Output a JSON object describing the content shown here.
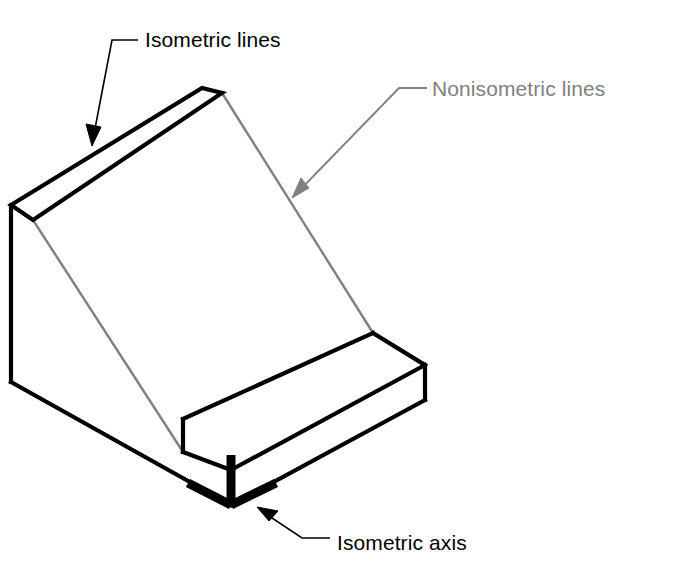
{
  "figure": {
    "background_color": "#ffffff",
    "line_color_isometric": "#000000",
    "line_color_nonisometric": "#808080",
    "axis_color": "#000000"
  },
  "annotations": {
    "isometric_lines": {
      "label": "Isometric lines",
      "color": "#000000",
      "text_x": 145,
      "text_y": 47,
      "leader_path": "M 138 40 L 112 40 L 93 139",
      "arrow_points": "92,146 86,124 101,127"
    },
    "nonisometric_lines": {
      "label": "Nonisometric lines",
      "color": "#808080",
      "text_x": 432,
      "text_y": 96,
      "leader_path": "M 427 88 L 399 88 L 296 194",
      "arrow_points": "292,198 301,178 309,188"
    },
    "isometric_axis": {
      "label": "Isometric axis",
      "color": "#000000",
      "text_x": 337,
      "text_y": 550,
      "leader_path": "M 330 538 L 302 538 L 263 512",
      "arrow_points": "257,507 278,511 269,521"
    }
  },
  "object_geometry": {
    "isometric_edges": [
      {
        "name": "top-face-outline",
        "d": "M 11 205 L 202 88 L 222 93 L 33 220 Z"
      },
      {
        "name": "left-vertical-edge",
        "d": "M 11 205 L 11 382"
      },
      {
        "name": "left-bottom-edge",
        "d": "M 11 382 L 231 505"
      },
      {
        "name": "base-bottom-right-edge",
        "d": "M 231 505 L 425 400"
      },
      {
        "name": "base-right-vertical-edge",
        "d": "M 425 400 L 425 365"
      },
      {
        "name": "base-top-right-edge",
        "d": "M 425 365 L 231 470"
      },
      {
        "name": "base-top-left-edge",
        "d": "M 231 470 L 183 452"
      },
      {
        "name": "base-front-left-vertical",
        "d": "M 183 452 L 183 419"
      },
      {
        "name": "base-far-top-edge",
        "d": "M 183 419 L 373 333"
      },
      {
        "name": "base-far-right-edge",
        "d": "M 373 333 L 425 365"
      },
      {
        "name": "base-front-corner-vertical",
        "d": "M 231 470 L 231 505"
      }
    ],
    "nonisometric_edges": [
      {
        "name": "inclined-face-left-edge",
        "d": "M 33 220 L 183 452"
      },
      {
        "name": "inclined-face-right-edge",
        "d": "M 222 93 L 373 333"
      }
    ]
  },
  "isometric_axis_marker": {
    "name": "isometric-axis-y-marker",
    "vertical_stem": "M 231 455 L 231 505",
    "left_arm": "M 231 505 L 188 483",
    "right_arm": "M 231 505 L 276 483",
    "stroke_width": 9
  },
  "stroke_widths": {
    "isometric_edge": 4.2,
    "nonisometric_edge": 2.4,
    "leader_line": 1.6
  }
}
